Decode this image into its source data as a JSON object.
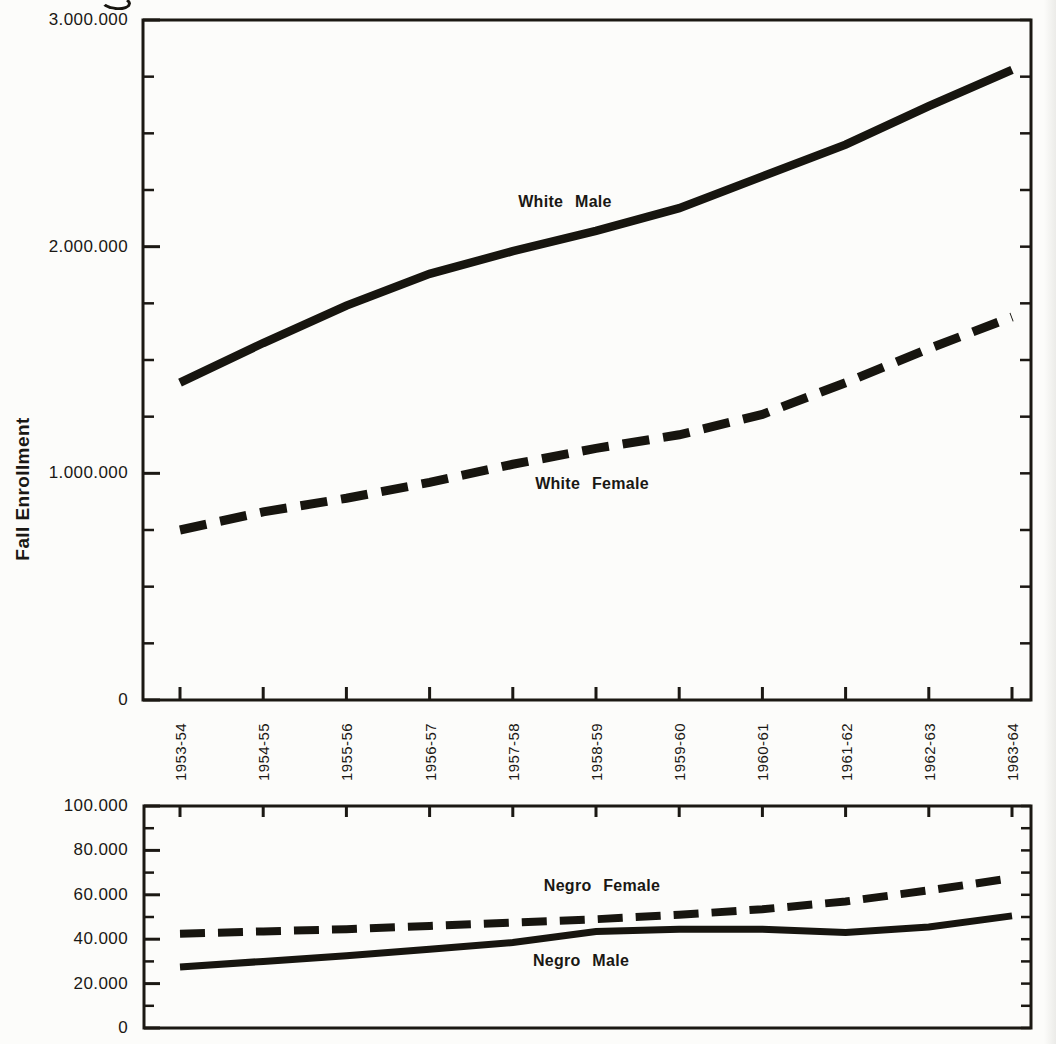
{
  "chart_data": [
    {
      "type": "line",
      "title": "",
      "ylabel": "Fall Enrollment",
      "xlabel": "",
      "legend_position": "inline-labels",
      "grid": false,
      "ylim": [
        0,
        3000000
      ],
      "minor_tick_step": 250000,
      "categories": [
        "1953-54",
        "1954-55",
        "1955-56",
        "1956-57",
        "1957-58",
        "1958-59",
        "1959-60",
        "1960-61",
        "1961-62",
        "1962-63",
        "1963-64"
      ],
      "y_ticks": [
        {
          "label": "3.000.000",
          "value": 3000000
        },
        {
          "label": "2.000.000",
          "value": 2000000
        },
        {
          "label": "1.000.000",
          "value": 1000000
        },
        {
          "label": "0",
          "value": 0
        }
      ],
      "series": [
        {
          "name": "White Male",
          "style": "solid",
          "values": [
            1400000,
            1575000,
            1740000,
            1880000,
            1980000,
            2070000,
            2170000,
            2310000,
            2450000,
            2620000,
            2780000
          ]
        },
        {
          "name": "White Female",
          "style": "dashed",
          "values": [
            750000,
            830000,
            890000,
            960000,
            1040000,
            1110000,
            1170000,
            1260000,
            1400000,
            1550000,
            1690000
          ]
        }
      ]
    },
    {
      "type": "line",
      "title": "",
      "ylabel": "",
      "xlabel": "",
      "legend_position": "inline-labels",
      "grid": false,
      "ylim": [
        0,
        100000
      ],
      "minor_tick_step": 10000,
      "categories": [
        "1953-54",
        "1954-55",
        "1955-56",
        "1956-57",
        "1957-58",
        "1958-59",
        "1959-60",
        "1960-61",
        "1961-62",
        "1962-63",
        "1963-64"
      ],
      "y_ticks": [
        {
          "label": "100.000",
          "value": 100000
        },
        {
          "label": "80.000",
          "value": 80000
        },
        {
          "label": "60.000",
          "value": 60000
        },
        {
          "label": "40.000",
          "value": 40000
        },
        {
          "label": "20.000",
          "value": 20000
        },
        {
          "label": "0",
          "value": 0
        }
      ],
      "series": [
        {
          "name": "Negro Female",
          "style": "dashed",
          "values": [
            42500,
            43500,
            44500,
            46000,
            47500,
            49000,
            51000,
            53500,
            57000,
            62000,
            67500
          ]
        },
        {
          "name": "Negro Male",
          "style": "solid",
          "values": [
            27500,
            30000,
            32500,
            35500,
            38500,
            43500,
            44500,
            44500,
            43000,
            45500,
            50500
          ]
        }
      ]
    }
  ]
}
